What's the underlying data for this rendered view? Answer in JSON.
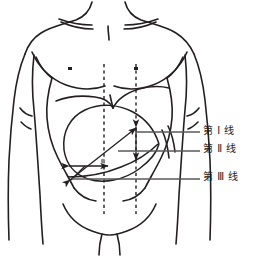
{
  "figure": {
    "colors": {
      "outline": "#231f20",
      "annotation_line": "#595959",
      "arrow": "#231f20",
      "background": "#ffffff"
    }
  },
  "labels": {
    "line_1": "第 Ⅰ 线",
    "line_2": "第 Ⅱ 线",
    "line_3": "第 Ⅲ 线"
  },
  "markers": {
    "left_nipple": "nipple-mark-left",
    "right_nipple": "nipple-mark-right",
    "midclavicular_dashed_left": "midclavicular-dashed-line-left",
    "midclavicular_dashed_right": "midclavicular-dashed-line-right"
  },
  "measurement_arrows": {
    "diagonal_arrow": "line-I-diagonal-double-arrow",
    "vertical_arrow": "line-II-vertical-double-arrow",
    "horizontal_arrow": "line-III-horizontal-double-arrow"
  }
}
